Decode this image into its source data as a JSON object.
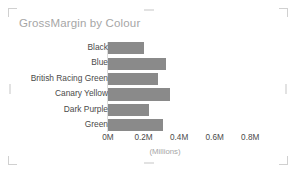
{
  "visual": {
    "title": "GrossMargin by Colour",
    "selected": true,
    "background_color": "#ffffff",
    "title_color": "#a6a6a6",
    "bar_color": "#8a8a8a",
    "axis_text_color": "#4a4a4a"
  },
  "axis": {
    "caption": "(Millions)",
    "ticks": [
      {
        "label": "0M",
        "value": 0.0
      },
      {
        "label": "0.2M",
        "value": 0.2
      },
      {
        "label": "0.4M",
        "value": 0.4
      },
      {
        "label": "0.6M",
        "value": 0.6
      },
      {
        "label": "0.8M",
        "value": 0.8
      }
    ]
  },
  "chart_data": {
    "type": "bar",
    "orientation": "horizontal",
    "title": "GrossMargin by Colour",
    "xlabel": "(Millions)",
    "ylabel": "",
    "xlim": [
      0,
      0.9
    ],
    "grid": false,
    "legend": null,
    "units": "Millions",
    "categories": [
      "Black",
      "Blue",
      "British Racing Green",
      "Canary Yellow",
      "Dark Purple",
      "Green"
    ],
    "values": [
      0.2,
      0.325,
      0.28,
      0.35,
      0.23,
      0.31
    ],
    "value_labels": [
      "0.20M",
      "0.33M",
      "0.28M",
      "0.35M",
      "0.23M",
      "0.31M"
    ],
    "series": [
      {
        "name": "GrossMargin",
        "color": "#8a8a8a",
        "values": [
          0.2,
          0.325,
          0.28,
          0.35,
          0.23,
          0.31
        ]
      }
    ]
  }
}
